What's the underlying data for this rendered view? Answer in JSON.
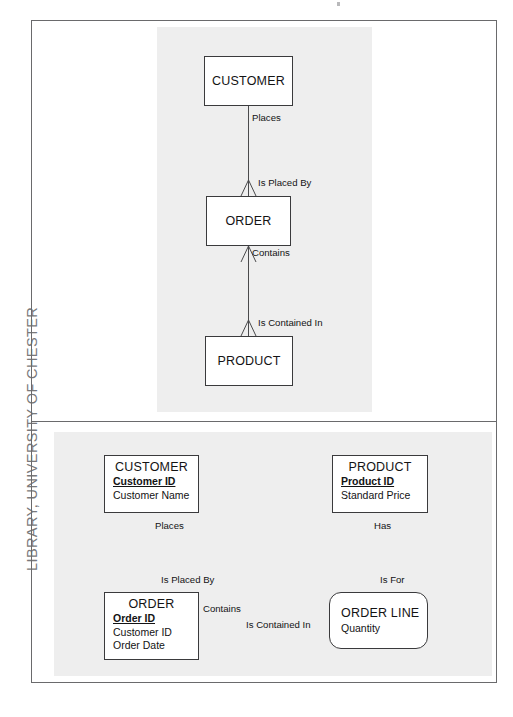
{
  "page": {
    "library_stamp": "LIBRARY, UNIVERSITY OF CHESTER",
    "background_color": "#ffffff",
    "frame_color": "#6a6a6c",
    "panel_color": "#eeeeee",
    "entity_border_color": "#3a3a3c",
    "text_color": "#131314"
  },
  "figures": [
    {
      "id": "top-figure",
      "notation": "crows-foot",
      "entities": [
        {
          "id": "customer",
          "name": "CUSTOMER",
          "shape": "rectangle",
          "attributes": []
        },
        {
          "id": "order",
          "name": "ORDER",
          "shape": "rectangle",
          "attributes": []
        },
        {
          "id": "product",
          "name": "PRODUCT",
          "shape": "rectangle",
          "attributes": []
        }
      ],
      "relationships": [
        {
          "id": "customer-order",
          "from": "customer",
          "to": "order",
          "forward_label": "Places",
          "reverse_label": "Is Placed By"
        },
        {
          "id": "order-product",
          "from": "order",
          "to": "product",
          "forward_label": "Contains",
          "reverse_label": "Is Contained In"
        }
      ]
    },
    {
      "id": "bottom-figure",
      "notation": "crows-foot",
      "entities": [
        {
          "id": "customer2",
          "name": "CUSTOMER",
          "shape": "rectangle",
          "attributes": [
            {
              "label": "Customer ID",
              "key": true
            },
            {
              "label": "Customer Name",
              "key": false
            }
          ]
        },
        {
          "id": "product2",
          "name": "PRODUCT",
          "shape": "rectangle",
          "attributes": [
            {
              "label": "Product ID",
              "key": true
            },
            {
              "label": "Standard Price",
              "key": false
            }
          ]
        },
        {
          "id": "order2",
          "name": "ORDER",
          "shape": "rectangle",
          "attributes": [
            {
              "label": "Order ID",
              "key": true
            },
            {
              "label": "Customer ID",
              "key": false
            },
            {
              "label": "Order Date",
              "key": false
            }
          ]
        },
        {
          "id": "orderline",
          "name": "ORDER LINE",
          "shape": "rounded-rectangle",
          "attributes": [
            {
              "label": "Quantity",
              "key": false
            }
          ]
        }
      ],
      "relationships": [
        {
          "id": "customer2-order2",
          "from": "customer2",
          "to": "order2",
          "forward_label": "Places",
          "reverse_label": "Is Placed By"
        },
        {
          "id": "order2-orderline",
          "from": "order2",
          "to": "orderline",
          "forward_label": "Contains",
          "reverse_label": "Is Contained In"
        },
        {
          "id": "product2-orderline",
          "from": "product2",
          "to": "orderline",
          "forward_label": "Has",
          "reverse_label": "Is For"
        }
      ]
    }
  ]
}
